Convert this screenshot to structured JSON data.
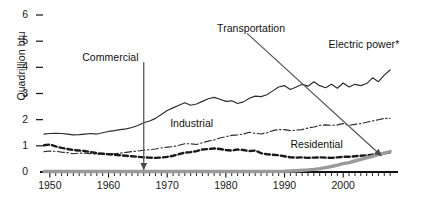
{
  "chart_data": {
    "type": "line",
    "title": "",
    "subtitle": "",
    "xlabel": "",
    "ylabel": "Quadrillion btu",
    "xlim": [
      1949,
      2009
    ],
    "ylim": [
      0,
      6.4
    ],
    "grid": false,
    "legend_position": "inline-annotations",
    "ytick_labels": [
      "0",
      "1",
      "2",
      "3",
      "4",
      "5",
      "6"
    ],
    "ytick_values": [
      0,
      1,
      2,
      3,
      4,
      5,
      6
    ],
    "xtick_labels": [
      "1950",
      "1960",
      "1970",
      "1980",
      "1990",
      "2000"
    ],
    "xtick_values": [
      1950,
      1960,
      1970,
      1980,
      1990,
      2000
    ],
    "minor_xticks_interval": 1,
    "annotations": [
      {
        "text": "Commercial",
        "label_x": 1955.5,
        "label_y": 4.35,
        "target_x": 1966,
        "target_y": 0.05,
        "style": "vertical-arrow"
      },
      {
        "text": "Transportation",
        "label_x": 1978.5,
        "label_y": 5.45,
        "target_x": 2006.5,
        "target_y": 0.62,
        "style": "diagonal-arrow"
      },
      {
        "text": "Electric power*",
        "label_x": 1997.5,
        "label_y": 4.85,
        "target_x": null,
        "target_y": null,
        "style": "plain"
      },
      {
        "text": "Industrial",
        "label_x": 1970.5,
        "label_y": 1.85,
        "target_x": null,
        "target_y": null,
        "style": "plain"
      },
      {
        "text": "Residential",
        "label_x": 1991.0,
        "label_y": 1.02,
        "target_x": null,
        "target_y": null,
        "style": "plain"
      }
    ],
    "series": [
      {
        "name": "Electric power*",
        "style": "solid",
        "color": "#2b2b2b",
        "x": [
          1949,
          1950,
          1951,
          1952,
          1953,
          1954,
          1955,
          1956,
          1957,
          1958,
          1959,
          1960,
          1961,
          1962,
          1963,
          1964,
          1965,
          1966,
          1967,
          1968,
          1969,
          1970,
          1971,
          1972,
          1973,
          1974,
          1975,
          1976,
          1977,
          1978,
          1979,
          1980,
          1981,
          1982,
          1983,
          1984,
          1985,
          1986,
          1987,
          1988,
          1989,
          1990,
          1991,
          1992,
          1993,
          1994,
          1995,
          1996,
          1997,
          1998,
          1999,
          2000,
          2001,
          2002,
          2003,
          2004,
          2005,
          2006,
          2007,
          2008
        ],
        "y": [
          1.45,
          1.47,
          1.48,
          1.47,
          1.45,
          1.42,
          1.43,
          1.45,
          1.47,
          1.45,
          1.5,
          1.55,
          1.58,
          1.62,
          1.65,
          1.7,
          1.78,
          1.88,
          1.95,
          2.05,
          2.2,
          2.35,
          2.45,
          2.55,
          2.65,
          2.55,
          2.6,
          2.7,
          2.8,
          2.85,
          2.78,
          2.7,
          2.72,
          2.62,
          2.68,
          2.82,
          2.9,
          2.88,
          2.95,
          3.1,
          3.25,
          3.3,
          3.15,
          3.25,
          3.35,
          3.28,
          3.45,
          3.3,
          3.22,
          3.35,
          3.2,
          3.4,
          3.25,
          3.35,
          3.3,
          3.38,
          3.6,
          3.45,
          3.7,
          3.9
        ]
      },
      {
        "name": "Industrial",
        "style": "dashdot",
        "color": "#2b2b2b",
        "x": [
          1949,
          1950,
          1951,
          1952,
          1953,
          1954,
          1955,
          1956,
          1957,
          1958,
          1959,
          1960,
          1961,
          1962,
          1963,
          1964,
          1965,
          1966,
          1967,
          1968,
          1969,
          1970,
          1971,
          1972,
          1973,
          1974,
          1975,
          1976,
          1977,
          1978,
          1979,
          1980,
          1981,
          1982,
          1983,
          1984,
          1985,
          1986,
          1987,
          1988,
          1989,
          1990,
          1991,
          1992,
          1993,
          1994,
          1995,
          1996,
          1997,
          1998,
          1999,
          2000,
          2001,
          2002,
          2003,
          2004,
          2005,
          2006,
          2007,
          2008
        ],
        "y": [
          0.78,
          0.8,
          0.79,
          0.76,
          0.74,
          0.7,
          0.72,
          0.72,
          0.7,
          0.68,
          0.7,
          0.7,
          0.7,
          0.72,
          0.75,
          0.78,
          0.8,
          0.83,
          0.85,
          0.88,
          0.92,
          0.95,
          0.97,
          1.02,
          1.08,
          1.08,
          1.05,
          1.12,
          1.18,
          1.22,
          1.3,
          1.35,
          1.4,
          1.42,
          1.45,
          1.52,
          1.48,
          1.45,
          1.5,
          1.58,
          1.62,
          1.62,
          1.58,
          1.6,
          1.62,
          1.68,
          1.72,
          1.78,
          1.8,
          1.78,
          1.8,
          1.85,
          1.78,
          1.82,
          1.85,
          1.9,
          1.95,
          2.0,
          2.05,
          2.05
        ]
      },
      {
        "name": "Residential",
        "style": "dashed",
        "color": "#1a1a1a",
        "x": [
          1949,
          1950,
          1951,
          1952,
          1953,
          1954,
          1955,
          1956,
          1957,
          1958,
          1959,
          1960,
          1961,
          1962,
          1963,
          1964,
          1965,
          1966,
          1967,
          1968,
          1969,
          1970,
          1971,
          1972,
          1973,
          1974,
          1975,
          1976,
          1977,
          1978,
          1979,
          1980,
          1981,
          1982,
          1983,
          1984,
          1985,
          1986,
          1987,
          1988,
          1989,
          1990,
          1991,
          1992,
          1993,
          1994,
          1995,
          1996,
          1997,
          1998,
          1999,
          2000,
          2001,
          2002,
          2003,
          2004,
          2005,
          2006,
          2007,
          2008
        ],
        "y": [
          1.02,
          1.05,
          0.98,
          0.92,
          0.88,
          0.84,
          0.82,
          0.8,
          0.76,
          0.72,
          0.7,
          0.68,
          0.66,
          0.64,
          0.62,
          0.6,
          0.58,
          0.56,
          0.55,
          0.54,
          0.55,
          0.58,
          0.62,
          0.68,
          0.74,
          0.76,
          0.8,
          0.86,
          0.88,
          0.9,
          0.88,
          0.84,
          0.82,
          0.86,
          0.84,
          0.8,
          0.82,
          0.72,
          0.68,
          0.66,
          0.64,
          0.6,
          0.56,
          0.55,
          0.56,
          0.54,
          0.55,
          0.56,
          0.55,
          0.54,
          0.56,
          0.58,
          0.58,
          0.6,
          0.62,
          0.64,
          0.66,
          0.68,
          0.72,
          0.74
        ]
      },
      {
        "name": "Transportation",
        "style": "thick-gray",
        "color": "#9a9a9a",
        "x": [
          1949,
          1955,
          1960,
          1965,
          1970,
          1975,
          1980,
          1985,
          1990,
          1992,
          1994,
          1995,
          1996,
          1997,
          1998,
          1999,
          2000,
          2001,
          2002,
          2003,
          2004,
          2005,
          2006,
          2007,
          2008
        ],
        "y": [
          0.02,
          0.02,
          0.02,
          0.02,
          0.02,
          0.02,
          0.02,
          0.02,
          0.03,
          0.05,
          0.08,
          0.1,
          0.13,
          0.17,
          0.21,
          0.26,
          0.32,
          0.36,
          0.42,
          0.48,
          0.54,
          0.6,
          0.66,
          0.72,
          0.78
        ]
      }
    ]
  },
  "axis": {
    "ylabel": "Quadrillion btu"
  }
}
